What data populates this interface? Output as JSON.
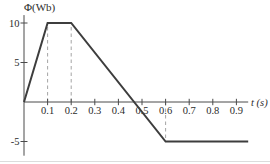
{
  "chart_data": {
    "type": "line",
    "title": "",
    "ylabel": "Φ(Wb)",
    "xlabel": "t (s)",
    "x_axis_range": [
      0,
      0.95
    ],
    "y_axis_range": [
      -6.8,
      11.0
    ],
    "grid": false,
    "legend": false,
    "x_ticks": [
      {
        "value": 0.1,
        "label": "0.1"
      },
      {
        "value": 0.2,
        "label": "0.2"
      },
      {
        "value": 0.3,
        "label": "0.3"
      },
      {
        "value": 0.4,
        "label": "0.4"
      },
      {
        "value": 0.5,
        "label": "0.5"
      },
      {
        "value": 0.6,
        "label": "0.6"
      },
      {
        "value": 0.7,
        "label": "0.7"
      },
      {
        "value": 0.8,
        "label": "0.8"
      },
      {
        "value": 0.9,
        "label": "0.9"
      }
    ],
    "y_ticks": [
      {
        "value": 10,
        "label": "10"
      },
      {
        "value": 5,
        "label": "5"
      },
      {
        "value": -5,
        "label": "-5"
      }
    ],
    "series": [
      {
        "name": "magnetic-flux",
        "points": [
          [
            0,
            0
          ],
          [
            0.1,
            10
          ],
          [
            0.2,
            10
          ],
          [
            0.6,
            -5
          ],
          [
            0.95,
            -5
          ]
        ]
      }
    ],
    "guides": [
      {
        "x": 0.1,
        "y_from": 0,
        "y_to": 10
      },
      {
        "x": 0.2,
        "y_from": 0,
        "y_to": 10
      },
      {
        "x": 0.6,
        "y_from": 0,
        "y_to": -5
      }
    ],
    "colors": {
      "line": "#3d3d3d",
      "axis": "#4a4a4a",
      "guide": "#9a9a9a",
      "text": "#2b2b2b",
      "page_edge": "#dcdcdc"
    }
  }
}
